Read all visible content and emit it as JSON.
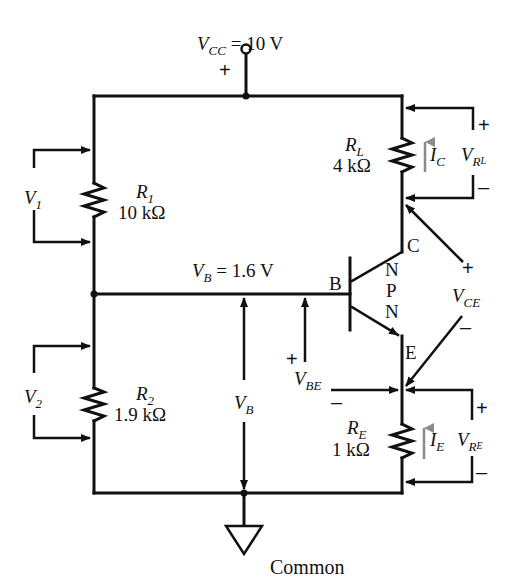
{
  "diagram": {
    "type": "circuit",
    "supply": {
      "symbol": "V",
      "subscript": "CC",
      "value": "= 10 V",
      "polarity": "+"
    },
    "resistors": [
      {
        "id": "R1",
        "symbol": "R",
        "subscript": "1",
        "value": "10 kΩ",
        "voltage_symbol": "V",
        "voltage_subscript": "1"
      },
      {
        "id": "R2",
        "symbol": "R",
        "subscript": "2",
        "value": "1.9 kΩ",
        "voltage_symbol": "V",
        "voltage_subscript": "2"
      },
      {
        "id": "RL",
        "symbol": "R",
        "subscript": "L",
        "value": "4 kΩ",
        "current_symbol": "I",
        "current_subscript": "C",
        "voltage_symbol": "V",
        "voltage_subscript": "R",
        "voltage_subsubscript": "L",
        "plus": "+",
        "minus": "–"
      },
      {
        "id": "RE",
        "symbol": "R",
        "subscript": "E",
        "value": "1 kΩ",
        "current_symbol": "I",
        "current_subscript": "E",
        "voltage_symbol": "V",
        "voltage_subscript": "R",
        "voltage_subsubscript": "E",
        "plus": "+",
        "minus": "–"
      }
    ],
    "base_node": {
      "symbol": "V",
      "subscript": "B",
      "value": "= 1.6 V"
    },
    "vb_label": {
      "symbol": "V",
      "subscript": "B"
    },
    "transistor": {
      "type_letters": [
        "N",
        "P",
        "N"
      ],
      "base": "B",
      "collector": "C",
      "emitter": "E"
    },
    "vbe": {
      "symbol": "V",
      "subscript": "BE",
      "plus": "+",
      "minus": "–"
    },
    "vce": {
      "symbol": "V",
      "subscript": "CE",
      "plus": "+",
      "minus": "–"
    },
    "ground": {
      "label": "Common"
    },
    "colors": {
      "wire": "#111111",
      "current_arrow": "#8a8a8a",
      "background": "#ffffff"
    }
  }
}
